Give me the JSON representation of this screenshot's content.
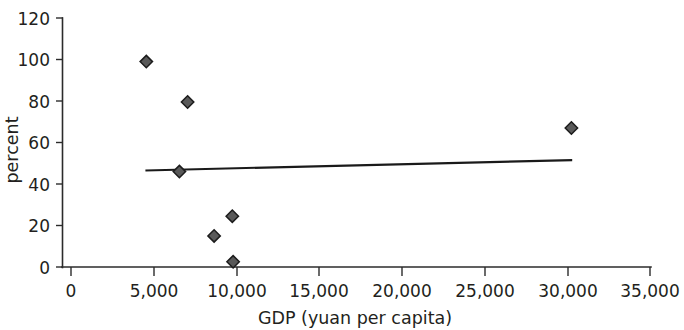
{
  "chart_data": {
    "type": "scatter",
    "title": "",
    "subtitle": "",
    "xlabel": "GDP (yuan per capita)",
    "ylabel": "percent",
    "xlim": [
      0,
      35000
    ],
    "ylim": [
      0,
      120
    ],
    "grid": false,
    "legend": null,
    "x_ticks": [
      0,
      5000,
      10000,
      15000,
      20000,
      25000,
      30000,
      35000
    ],
    "x_tick_labels": [
      "0",
      "5,000",
      "10,000",
      "15,000",
      "20,000",
      "25,000",
      "30,000",
      "35,000"
    ],
    "y_ticks": [
      0,
      20,
      40,
      60,
      80,
      100,
      120
    ],
    "y_tick_labels": [
      "0",
      "20",
      "40",
      "60",
      "80",
      "100",
      "120"
    ],
    "series": [
      {
        "name": "observations",
        "marker": "diamond",
        "marker_color": "#595959",
        "marker_edge_color": "#1c1c1c",
        "points": [
          {
            "x": 4550,
            "y": 99
          },
          {
            "x": 7050,
            "y": 79.5
          },
          {
            "x": 6550,
            "y": 46
          },
          {
            "x": 8650,
            "y": 15
          },
          {
            "x": 9750,
            "y": 24.5
          },
          {
            "x": 9800,
            "y": 2.5
          },
          {
            "x": 30250,
            "y": 67
          }
        ]
      },
      {
        "name": "trendline",
        "type": "line",
        "color": "#1a1a1a",
        "points": [
          {
            "x": 4500,
            "y": 46.5
          },
          {
            "x": 30300,
            "y": 51.5
          }
        ]
      }
    ]
  },
  "axes": {
    "x_title": "GDP (yuan per capita)",
    "y_title": "percent"
  }
}
